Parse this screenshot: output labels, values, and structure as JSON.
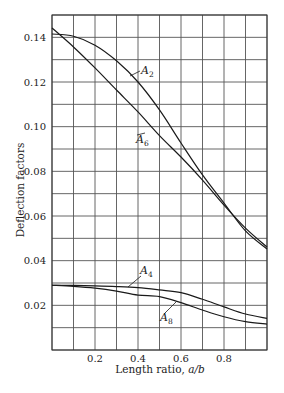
{
  "chart_data": {
    "type": "line",
    "title": "",
    "xlabel": "Length ratio, a/b",
    "xlabel_plain": "Length ratio, ",
    "xlabel_italic": "a/b",
    "ylabel": "Deflection factors",
    "xlim": [
      0.0,
      1.0
    ],
    "ylim": [
      0.0,
      0.15
    ],
    "grid": true,
    "legend": "inline labels with leader lines",
    "x_ticks": [
      0.2,
      0.4,
      0.6,
      0.8
    ],
    "x_tick_labels": [
      "0.2",
      "0.4",
      "0.6",
      "0.8"
    ],
    "y_ticks": [
      0.02,
      0.04,
      0.06,
      0.08,
      0.1,
      0.12,
      0.14
    ],
    "y_tick_labels": [
      "0.02",
      "0.04",
      "0.06",
      "0.08",
      "0.10",
      "0.12",
      "0.14"
    ],
    "x": [
      0.0,
      0.1,
      0.2,
      0.3,
      0.4,
      0.5,
      0.6,
      0.7,
      0.8,
      0.9,
      1.0
    ],
    "series": [
      {
        "name": "A2",
        "label_main": "A",
        "label_sub": "2",
        "values": [
          0.1415,
          0.1405,
          0.1365,
          0.1295,
          0.12,
          0.1075,
          0.0927,
          0.0784,
          0.0658,
          0.0533,
          0.0452
        ]
      },
      {
        "name": "A6",
        "label_main": "A",
        "label_sub": "6",
        "values": [
          0.1442,
          0.1357,
          0.1263,
          0.1164,
          0.1066,
          0.096,
          0.0864,
          0.0761,
          0.0649,
          0.0546,
          0.0461
        ]
      },
      {
        "name": "A4",
        "label_main": "A",
        "label_sub": "4",
        "values": [
          0.029,
          0.0289,
          0.0287,
          0.0284,
          0.0279,
          0.0269,
          0.0257,
          0.0227,
          0.0193,
          0.0161,
          0.0142
        ]
      },
      {
        "name": "A8",
        "label_main": "A",
        "label_sub": "8",
        "values": [
          0.029,
          0.0285,
          0.0277,
          0.0264,
          0.0246,
          0.0239,
          0.0212,
          0.0179,
          0.0149,
          0.0127,
          0.0116
        ]
      }
    ],
    "grid_x_step": 0.1,
    "grid_y_step": 0.01,
    "colors": {
      "line": "#1a1a1a",
      "grid": "#555555",
      "background": "#ffffff"
    }
  }
}
